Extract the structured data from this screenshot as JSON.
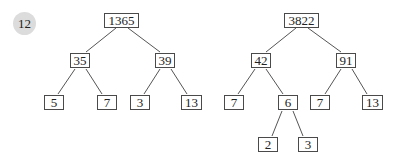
{
  "problem_number": "12",
  "colors": {
    "edge": "#555555",
    "box_border": "#4a4a4a",
    "badge_bg": "#dcdcdc",
    "text": "#222222"
  },
  "trees": [
    {
      "root": "1365",
      "nodes": [
        {
          "id": "n1365",
          "label": "1365",
          "x": 104,
          "y": 13,
          "w": 35
        },
        {
          "id": "n35",
          "label": "35",
          "x": 70,
          "y": 53,
          "w": 20
        },
        {
          "id": "n39",
          "label": "39",
          "x": 155,
          "y": 53,
          "w": 20
        },
        {
          "id": "n5",
          "label": "5",
          "x": 44,
          "y": 95,
          "w": 20
        },
        {
          "id": "n7a",
          "label": "7",
          "x": 97,
          "y": 95,
          "w": 20
        },
        {
          "id": "n3a",
          "label": "3",
          "x": 130,
          "y": 95,
          "w": 20
        },
        {
          "id": "n13a",
          "label": "13",
          "x": 181,
          "y": 95,
          "w": 21
        }
      ],
      "edges": [
        {
          "from": [
            116,
            28
          ],
          "to": [
            86,
            52
          ]
        },
        {
          "from": [
            128,
            28
          ],
          "to": [
            160,
            52
          ]
        },
        {
          "from": [
            75,
            69
          ],
          "to": [
            58,
            94
          ]
        },
        {
          "from": [
            86,
            69
          ],
          "to": [
            102,
            94
          ]
        },
        {
          "from": [
            160,
            69
          ],
          "to": [
            144,
            94
          ]
        },
        {
          "from": [
            171,
            69
          ],
          "to": [
            187,
            94
          ]
        }
      ]
    },
    {
      "root": "3822",
      "nodes": [
        {
          "id": "n3822",
          "label": "3822",
          "x": 284,
          "y": 13,
          "w": 35
        },
        {
          "id": "n42",
          "label": "42",
          "x": 251,
          "y": 53,
          "w": 20
        },
        {
          "id": "n91",
          "label": "91",
          "x": 336,
          "y": 53,
          "w": 20
        },
        {
          "id": "n7b",
          "label": "7",
          "x": 224,
          "y": 95,
          "w": 20
        },
        {
          "id": "n6",
          "label": "6",
          "x": 278,
          "y": 95,
          "w": 20
        },
        {
          "id": "n7c",
          "label": "7",
          "x": 310,
          "y": 95,
          "w": 20
        },
        {
          "id": "n13b",
          "label": "13",
          "x": 362,
          "y": 95,
          "w": 21
        },
        {
          "id": "n2",
          "label": "2",
          "x": 258,
          "y": 137,
          "w": 20
        },
        {
          "id": "n3b",
          "label": "3",
          "x": 298,
          "y": 137,
          "w": 20
        }
      ],
      "edges": [
        {
          "from": [
            296,
            28
          ],
          "to": [
            266,
            52
          ]
        },
        {
          "from": [
            308,
            28
          ],
          "to": [
            341,
            52
          ]
        },
        {
          "from": [
            255,
            69
          ],
          "to": [
            238,
            94
          ]
        },
        {
          "from": [
            266,
            69
          ],
          "to": [
            283,
            94
          ]
        },
        {
          "from": [
            341,
            69
          ],
          "to": [
            325,
            94
          ]
        },
        {
          "from": [
            352,
            69
          ],
          "to": [
            367,
            94
          ]
        },
        {
          "from": [
            282,
            111
          ],
          "to": [
            272,
            136
          ]
        },
        {
          "from": [
            293,
            111
          ],
          "to": [
            303,
            136
          ]
        }
      ]
    }
  ]
}
